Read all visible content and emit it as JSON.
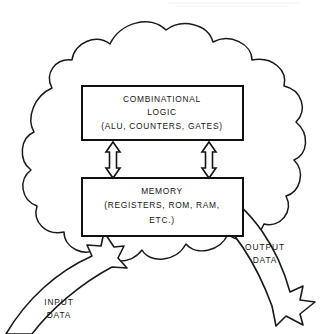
{
  "figure": {
    "background_color": "#ffffff",
    "line_color": "#1a1a1a"
  },
  "cloud": {
    "name": "system-boundary-cloud",
    "description": "scalloped cloud outline enclosing the logic and memory blocks"
  },
  "blocks": {
    "combinational_logic": {
      "line1": "COMBINATIONAL",
      "line2": "LOGIC",
      "line3": "(ALU, COUNTERS, GATES)"
    },
    "memory": {
      "line1": "MEMORY",
      "line2": "(REGISTERS, ROM, RAM,",
      "line3": "ETC.)"
    }
  },
  "connectors": {
    "left_bus": "double-headed-vertical-arrow",
    "right_bus": "double-headed-vertical-arrow"
  },
  "io_labels": {
    "input": {
      "line1": "INPUT",
      "line2": "DATA"
    },
    "output": {
      "line1": "OUTPUT",
      "line2": "DATA"
    }
  }
}
